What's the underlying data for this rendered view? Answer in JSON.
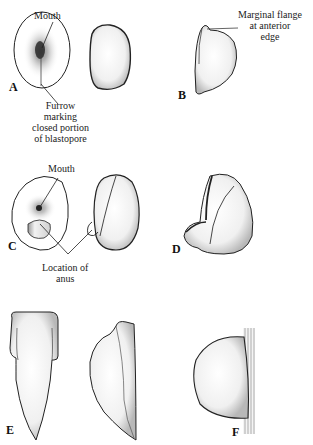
{
  "figure": {
    "panels": [
      {
        "id": "A",
        "letter": "A",
        "description": "Oral view of early embryo with mouth and furrow, plus side view"
      },
      {
        "id": "B",
        "letter": "B",
        "description": "Lateral view showing marginal flange at anterior edge"
      },
      {
        "id": "C",
        "letter": "C",
        "description": "Oral view showing mouth and anus location, plus side view"
      },
      {
        "id": "D",
        "letter": "D",
        "description": "Later stage with developing foot region"
      },
      {
        "id": "E",
        "letter": "E",
        "description": "Elongated ventral and lateral views"
      },
      {
        "id": "F",
        "letter": "F",
        "description": "Dome-shaped form attached to substrate"
      }
    ],
    "annotations": {
      "a_mouth": "Mouth",
      "a_furrow": [
        "Furrow",
        "marking",
        "closed portion",
        "of blastopore"
      ],
      "b_flange": [
        "Marginal flange",
        "at anterior",
        "edge"
      ],
      "c_mouth": "Mouth",
      "c_anus": [
        "Location of",
        "anus"
      ]
    },
    "colors": {
      "line": "#222222",
      "shade": "#8a8a8a",
      "background": "#ffffff"
    }
  }
}
